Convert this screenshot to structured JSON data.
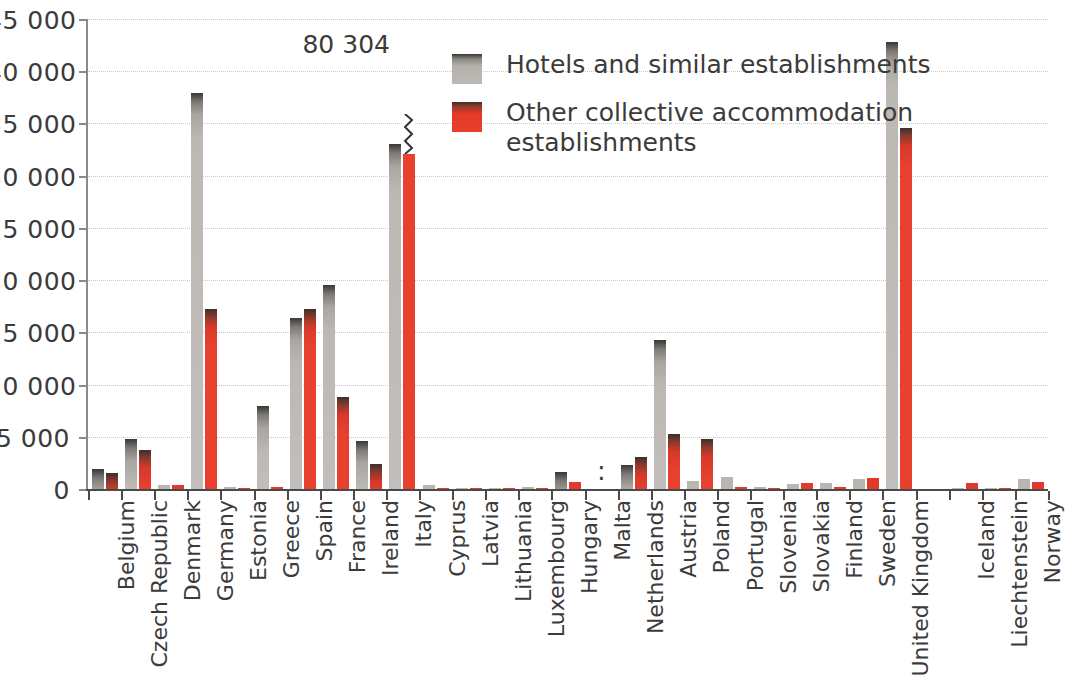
{
  "chart_data": {
    "type": "bar",
    "title": "",
    "xlabel": "",
    "ylabel": "",
    "ylim": [
      0,
      45000
    ],
    "ytick_values": [
      0,
      5000,
      10000,
      15000,
      20000,
      25000,
      30000,
      35000,
      40000,
      45000
    ],
    "ytick_labels": [
      "0",
      "5 000",
      "10 000",
      "15 000",
      "20 000",
      "25 000",
      "30 000",
      "35 000",
      "40 000",
      "45 000"
    ],
    "grid": true,
    "legend_position": "upper-center-right",
    "categories": [
      "Belgium",
      "Czech Republic",
      "Denmark",
      "Germany",
      "Estonia",
      "Greece",
      "Spain",
      "France",
      "Ireland",
      "Italy",
      "Cyprus",
      "Latvia",
      "Lithuania",
      "Luxembourg",
      "Hungary",
      "Malta",
      "Netherlands",
      "Austria",
      "Poland",
      "Portugal",
      "Slovenia",
      "Slovakia",
      "Finland",
      "Sweden",
      "United Kingdom",
      "Iceland",
      "Liechtenstein",
      "Norway"
    ],
    "series": [
      {
        "name": "Hotels and similar establishments",
        "color": "#bdb9b5",
        "values": [
          2000,
          4900,
          480,
          38000,
          250,
          8000,
          16500,
          19600,
          4700,
          33100,
          520,
          130,
          170,
          280,
          1700,
          null,
          2400,
          14400,
          900,
          1200,
          330,
          550,
          700,
          1100,
          42900,
          150,
          80,
          1100
        ]
      },
      {
        "name": "Other collective accommodation establishments",
        "color": "#e8402c",
        "values": [
          1600,
          3800,
          480,
          17300,
          180,
          270,
          17300,
          8900,
          2500,
          80304,
          120,
          170,
          190,
          230,
          800,
          null,
          3200,
          5400,
          4900,
          250,
          230,
          640,
          320,
          1150,
          34700,
          700,
          40,
          800
        ]
      }
    ],
    "annotations": [
      {
        "text": "80 304",
        "category": "Italy",
        "series": "Other collective accommodation establishments",
        "note": "value exceeds axis; bar drawn with axis break"
      }
    ],
    "missing_data_marker": ":",
    "missing_data_categories": [
      "Malta"
    ]
  },
  "legend": {
    "items": [
      {
        "label": "Hotels and similar establishments",
        "color": "#bdb9b5"
      },
      {
        "label": "Other collective accommodation establishments",
        "color": "#e8402c"
      }
    ]
  },
  "colors": {
    "grey_series": "#bdb9b5",
    "red_series": "#e8402c",
    "axis": "#4a4a4a",
    "grid": "#c9c9c9",
    "text": "#3b3b3b",
    "background": "#ffffff"
  }
}
